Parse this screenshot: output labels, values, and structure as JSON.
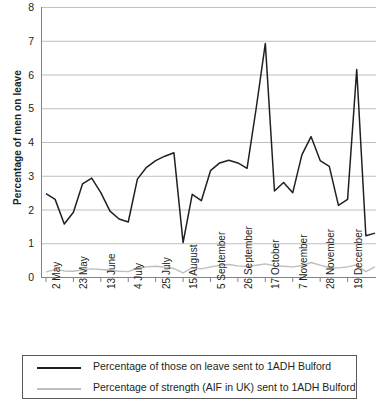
{
  "chart_data": {
    "type": "line",
    "title": "",
    "xlabel": "",
    "ylabel": "Percentage of men on leave",
    "ylim": [
      0,
      8
    ],
    "yticks": [
      0,
      1,
      2,
      3,
      4,
      5,
      6,
      7,
      8
    ],
    "grid": true,
    "legend_position": "bottom",
    "x_tick_labels": [
      "2 May",
      "23 May",
      "13 June",
      "4 July",
      "25 July",
      "15 August",
      "5 September",
      "26 September",
      "17 October",
      "7 November",
      "28 November",
      "19 December"
    ],
    "x_tick_indices": [
      0,
      3,
      6,
      9,
      12,
      15,
      18,
      21,
      24,
      27,
      30,
      33
    ],
    "x_interval": "weekly",
    "series": [
      {
        "name": "Percentage of those on leave sent to 1ADH Bulford",
        "color": "#231f20",
        "values": [
          2.47,
          2.3,
          1.57,
          1.92,
          2.76,
          2.93,
          2.5,
          1.95,
          1.72,
          1.63,
          2.9,
          3.25,
          3.45,
          3.58,
          3.68,
          1.02,
          2.45,
          2.26,
          3.15,
          3.38,
          3.46,
          3.38,
          3.22,
          5.0,
          6.92,
          2.55,
          2.8,
          2.5,
          3.62,
          4.16,
          3.45,
          3.28,
          2.12,
          2.3,
          6.15,
          1.22,
          1.3
        ]
      },
      {
        "name": "Percentage of strength (AIF in UK) sent to 1ADH Bulford",
        "color": "#bcbec0",
        "values": [
          0.15,
          0.22,
          0.18,
          0.17,
          0.21,
          0.24,
          0.22,
          0.2,
          0.17,
          0.16,
          0.26,
          0.3,
          0.32,
          0.29,
          0.25,
          0.12,
          0.28,
          0.24,
          0.3,
          0.34,
          0.37,
          0.33,
          0.31,
          0.35,
          0.39,
          0.33,
          0.32,
          0.3,
          0.34,
          0.43,
          0.35,
          0.28,
          0.27,
          0.3,
          0.36,
          0.16,
          0.3
        ]
      }
    ]
  },
  "legend": {
    "entries": [
      {
        "label": "Percentage of those on leave sent to 1ADH Bulford",
        "swatch": "black"
      },
      {
        "label": "Percentage of strength (AIF in UK) sent to 1ADH Bulford",
        "swatch": "grey"
      }
    ]
  },
  "colors": {
    "series_primary": "#231f20",
    "series_secondary": "#bcbec0",
    "gridline": "#bcbec0",
    "axis": "#808285",
    "background": "#ffffff"
  }
}
